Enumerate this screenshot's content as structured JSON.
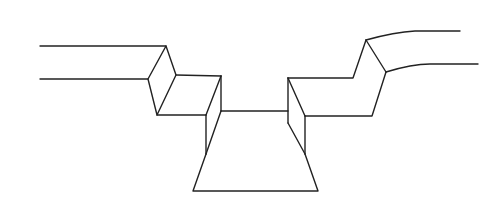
{
  "diagram": {
    "title": "",
    "canvas": {
      "width": 504,
      "height": 205
    },
    "colors": {
      "background": "#ffffff",
      "stroke": "#222222"
    },
    "stroke_width": 1.4,
    "parts": [
      {
        "id": "left-upper-rail",
        "path": "M40,46 L166,46"
      },
      {
        "id": "left-lower-rail",
        "path": "M40,79 L148,79"
      },
      {
        "id": "left-diamond-face",
        "path": "M166,46 L148,79 L157,115 L176,75 Z"
      },
      {
        "id": "left-step-top",
        "path": "M176,75 L221,76"
      },
      {
        "id": "left-step-bottom",
        "path": "M157,115 L206,115"
      },
      {
        "id": "left-step-diagonal",
        "path": "M221,76 L206,115"
      },
      {
        "id": "left-inner-vertical",
        "path": "M221,76 L221,111"
      },
      {
        "id": "left-outer-vertical",
        "path": "M206,115 L206,154"
      },
      {
        "id": "left-lower-diagonal",
        "path": "M221,111 L206,154"
      },
      {
        "id": "center-floor-line",
        "path": "M221,111 L288,111"
      },
      {
        "id": "trough-trapezoid",
        "path": "M206,154 L193,191 L318,191 L305,154"
      },
      {
        "id": "right-inner-vertical",
        "path": "M288,78 L288,123"
      },
      {
        "id": "right-lower-diagonal",
        "path": "M288,123 L305,154"
      },
      {
        "id": "right-step-diagonal",
        "path": "M288,78 L305,116"
      },
      {
        "id": "right-outer-vertical",
        "path": "M305,116 L305,154"
      },
      {
        "id": "right-step-top",
        "path": "M288,78 L353,78 L366,40"
      },
      {
        "id": "right-step-bottom",
        "path": "M305,116 L372,116 L386,72"
      },
      {
        "id": "right-diamond-edge",
        "path": "M366,40 L386,72"
      },
      {
        "id": "right-upper-rail",
        "path": "M366,40 Q395,32 415,31 L460,31"
      },
      {
        "id": "right-lower-rail",
        "path": "M386,72 Q412,64 430,64 L478,64"
      }
    ]
  }
}
